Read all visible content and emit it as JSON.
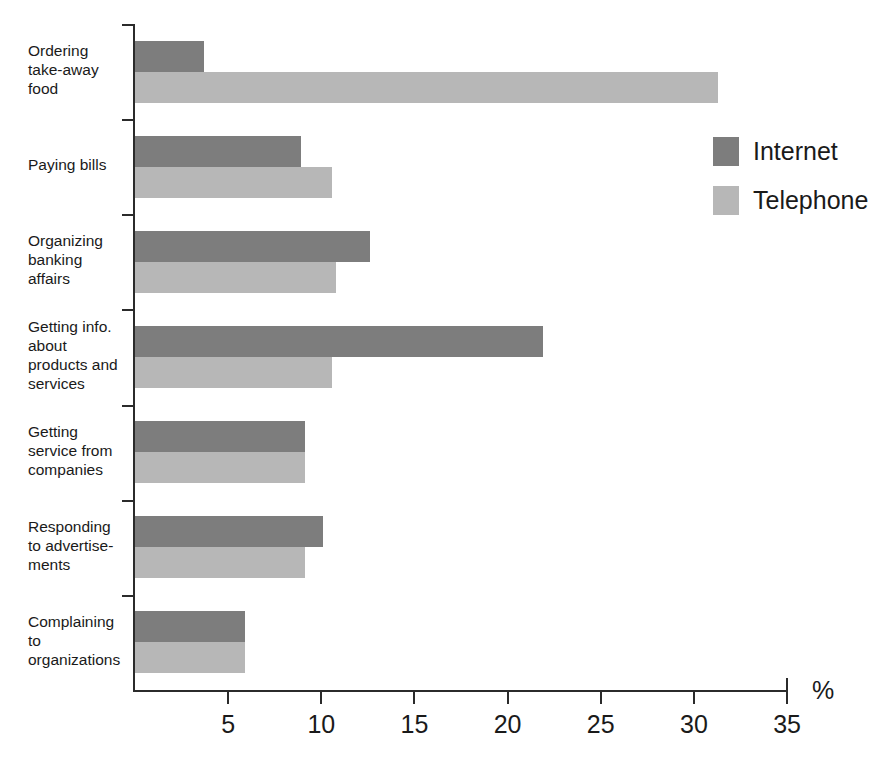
{
  "chart_data": {
    "type": "bar",
    "orientation": "horizontal",
    "title": "",
    "subtitle": "",
    "xlabel": "%",
    "ylabel": "",
    "xlim": [
      0,
      35
    ],
    "grid": false,
    "legend_position": "top-right",
    "categories": [
      "Ordering take-away food",
      "Paying bills",
      "Organizing banking affairs",
      "Getting info. about products and services",
      "Getting service from companies",
      "Responding to advertisements",
      "Complaining to organizations"
    ],
    "category_lines": [
      [
        "Ordering",
        "take-away",
        "food"
      ],
      [
        "Paying bills"
      ],
      [
        "Organizing",
        "banking",
        "affairs"
      ],
      [
        "Getting info.",
        "about",
        "products and",
        "services"
      ],
      [
        "Getting",
        "service from",
        "companies"
      ],
      [
        "Responding",
        "to advertise-",
        "ments"
      ],
      [
        "Complaining",
        "to",
        "organizations"
      ]
    ],
    "series": [
      {
        "name": "Internet",
        "color": "#7d7d7d",
        "values": [
          3.7,
          8.9,
          12.6,
          21.9,
          9.1,
          10.1,
          5.9
        ]
      },
      {
        "name": "Telephone",
        "color": "#b7b7b7",
        "values": [
          31.3,
          10.6,
          10.8,
          10.6,
          9.1,
          9.1,
          5.9
        ]
      }
    ],
    "x_ticks": [
      0,
      5,
      10,
      15,
      20,
      25,
      30,
      35
    ],
    "x_tick_labels": [
      "",
      "5",
      "10",
      "15",
      "20",
      "25",
      "30",
      "35"
    ]
  },
  "axis": {
    "unit_label": "%"
  },
  "legend": {
    "items": [
      {
        "label": "Internet",
        "color": "#7d7d7d"
      },
      {
        "label": "Telephone",
        "color": "#b7b7b7"
      }
    ]
  }
}
